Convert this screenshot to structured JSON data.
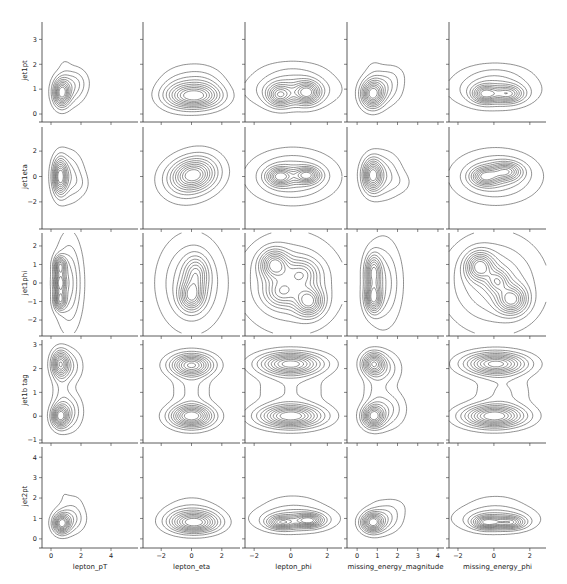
{
  "chart_data": {
    "type": "pairgrid-kde-contour",
    "title": "",
    "grid": false,
    "legend": "none",
    "x_variables": [
      {
        "name": "lepton_pT",
        "xlim": [
          -0.6,
          5.8
        ],
        "ticks": [
          0,
          2,
          4
        ],
        "tick_labels": [
          "0",
          "2",
          "4"
        ]
      },
      {
        "name": "lepton_eta",
        "xlim": [
          -3.2,
          3.2
        ],
        "ticks": [
          -2,
          0,
          2
        ],
        "tick_labels": [
          "−2",
          "0",
          "2"
        ]
      },
      {
        "name": "lepton_phi",
        "xlim": [
          -2.5,
          2.8
        ],
        "ticks": [
          -2,
          0,
          2
        ],
        "tick_labels": [
          "−2",
          "0",
          "2"
        ]
      },
      {
        "name": "missing_energy_magnitude",
        "xlim": [
          -0.5,
          4.3
        ],
        "ticks": [
          0,
          1,
          2,
          3,
          4
        ],
        "tick_labels": [
          "0",
          "1",
          "2",
          "3",
          "4"
        ]
      },
      {
        "name": "missing_energy_phi",
        "xlim": [
          -2.5,
          2.9
        ],
        "ticks": [
          -2,
          0,
          2
        ],
        "tick_labels": [
          "−2",
          "0",
          "2"
        ]
      }
    ],
    "y_variables": [
      {
        "name": "jet1pt",
        "ylim": [
          -0.2,
          3.7
        ],
        "ticks": [
          0,
          1,
          2,
          3
        ],
        "tick_labels": [
          "0",
          "1",
          "2",
          "3"
        ]
      },
      {
        "name": "jet1eta",
        "ylim": [
          -3.9,
          3.9
        ],
        "ticks": [
          -2,
          0,
          2
        ],
        "tick_labels": [
          "−2",
          "0",
          "2"
        ]
      },
      {
        "name": "jet1phi",
        "ylim": [
          -2.7,
          2.7
        ],
        "ticks": [
          -2,
          -1,
          0,
          1,
          2
        ],
        "tick_labels": [
          "−2",
          "−1",
          "0",
          "1",
          "2"
        ]
      },
      {
        "name": "jet1b tag",
        "ylim": [
          -1,
          3.2
        ],
        "ticks": [
          -1,
          0,
          1,
          2,
          3
        ],
        "tick_labels": [
          "−1",
          "0",
          "1",
          "2",
          "3"
        ]
      },
      {
        "name": "jet2pt",
        "ylim": [
          -0.3,
          4.5
        ],
        "ticks": [
          0,
          1,
          2,
          3,
          4
        ],
        "tick_labels": [
          "0",
          "1",
          "2",
          "3",
          "4"
        ]
      }
    ],
    "contour_levels": 10,
    "panels": [
      [
        {
          "blobs": [
            [
              0.7,
              0.85,
              0.35,
              0.35,
              1.0
            ],
            [
              1.3,
              1.1,
              0.6,
              0.45,
              0.35
            ],
            [
              1.9,
              1.3,
              0.5,
              0.35,
              0.08
            ],
            [
              0.9,
              2.0,
              0.3,
              0.25,
              0.05
            ]
          ]
        },
        {
          "blobs": [
            [
              0.2,
              0.7,
              1.1,
              0.3,
              1.0
            ],
            [
              -0.8,
              0.9,
              0.9,
              0.45,
              0.4
            ],
            [
              0.8,
              1.0,
              0.9,
              0.45,
              0.4
            ],
            [
              0.0,
              1.7,
              1.2,
              0.35,
              0.08
            ]
          ]
        },
        {
          "blobs": [
            [
              -0.6,
              0.75,
              0.45,
              0.28,
              0.8
            ],
            [
              0.9,
              0.85,
              0.45,
              0.28,
              0.9
            ],
            [
              0.1,
              1.0,
              1.4,
              0.45,
              0.5
            ],
            [
              0.1,
              1.8,
              1.3,
              0.3,
              0.1
            ]
          ]
        },
        {
          "blobs": [
            [
              0.75,
              0.8,
              0.35,
              0.35,
              1.0
            ],
            [
              1.3,
              1.1,
              0.55,
              0.45,
              0.35
            ],
            [
              1.9,
              1.6,
              0.4,
              0.3,
              0.06
            ],
            [
              0.8,
              1.9,
              0.3,
              0.3,
              0.05
            ]
          ]
        },
        {
          "blobs": [
            [
              -0.5,
              0.8,
              0.45,
              0.22,
              0.9
            ],
            [
              0.8,
              0.8,
              0.55,
              0.22,
              0.8
            ],
            [
              0.0,
              1.0,
              1.4,
              0.45,
              0.5
            ],
            [
              0.1,
              1.7,
              1.3,
              0.3,
              0.1
            ]
          ]
        }
      ],
      [
        {
          "blobs": [
            [
              0.6,
              0.0,
              0.3,
              0.9,
              1.0
            ],
            [
              1.2,
              0.0,
              0.6,
              1.2,
              0.35
            ],
            [
              2.0,
              -0.6,
              0.4,
              0.6,
              0.08
            ]
          ]
        },
        {
          "blobs": [
            [
              0.1,
              0.1,
              0.8,
              0.7,
              1.0
            ],
            [
              -0.6,
              -0.4,
              0.9,
              0.9,
              0.45
            ],
            [
              0.7,
              0.6,
              0.9,
              0.9,
              0.45
            ],
            [
              0.0,
              0.0,
              1.4,
              1.4,
              0.2
            ]
          ]
        },
        {
          "blobs": [
            [
              -0.6,
              0.0,
              0.45,
              0.45,
              0.85
            ],
            [
              0.9,
              0.1,
              0.45,
              0.4,
              0.85
            ],
            [
              0.1,
              0.0,
              1.4,
              1.2,
              0.5
            ]
          ]
        },
        {
          "blobs": [
            [
              0.75,
              0.1,
              0.3,
              0.8,
              1.0
            ],
            [
              1.3,
              0.1,
              0.55,
              1.1,
              0.35
            ],
            [
              2.2,
              -0.5,
              0.4,
              0.6,
              0.08
            ]
          ]
        },
        {
          "blobs": [
            [
              -0.5,
              0.0,
              0.5,
              0.45,
              0.85
            ],
            [
              0.7,
              0.4,
              0.55,
              0.45,
              0.8
            ],
            [
              0.1,
              0.0,
              1.4,
              1.2,
              0.5
            ]
          ]
        }
      ],
      [
        {
          "blobs": [
            [
              0.6,
              0.9,
              0.25,
              0.35,
              0.9
            ],
            [
              0.6,
              0.0,
              0.25,
              0.35,
              0.9
            ],
            [
              0.6,
              -0.9,
              0.25,
              0.35,
              0.9
            ],
            [
              1.2,
              0.0,
              0.55,
              1.5,
              0.45
            ]
          ]
        },
        {
          "blobs": [
            [
              0.0,
              -0.7,
              0.5,
              0.5,
              1.0
            ],
            [
              0.3,
              0.5,
              0.5,
              0.6,
              0.7
            ],
            [
              0.0,
              0.0,
              1.3,
              1.5,
              0.55
            ]
          ]
        },
        {
          "blobs": [
            [
              -0.9,
              1.0,
              0.5,
              0.5,
              0.9
            ],
            [
              1.0,
              -1.0,
              0.5,
              0.5,
              0.9
            ],
            [
              0.6,
              0.5,
              0.6,
              0.5,
              0.55
            ],
            [
              -0.5,
              -0.5,
              0.6,
              0.5,
              0.55
            ],
            [
              0.0,
              0.0,
              1.6,
              1.5,
              0.45
            ]
          ]
        },
        {
          "blobs": [
            [
              0.8,
              -0.8,
              0.25,
              0.5,
              1.0
            ],
            [
              0.8,
              0.6,
              0.25,
              0.6,
              0.85
            ],
            [
              1.3,
              0.0,
              0.55,
              1.4,
              0.4
            ]
          ]
        },
        {
          "blobs": [
            [
              -0.8,
              0.9,
              0.5,
              0.5,
              0.85
            ],
            [
              1.0,
              -0.9,
              0.55,
              0.5,
              0.85
            ],
            [
              0.2,
              0.1,
              0.4,
              0.4,
              0.55
            ],
            [
              0.0,
              0.0,
              1.6,
              1.5,
              0.45
            ]
          ]
        }
      ],
      [
        {
          "blobs": [
            [
              0.6,
              2.2,
              0.35,
              0.35,
              0.9
            ],
            [
              0.6,
              0.0,
              0.35,
              0.3,
              1.0
            ],
            [
              1.2,
              0.2,
              0.55,
              0.5,
              0.35
            ],
            [
              1.2,
              2.1,
              0.55,
              0.45,
              0.3
            ],
            [
              0.7,
              1.1,
              0.4,
              0.6,
              0.15
            ]
          ]
        },
        {
          "blobs": [
            [
              0.0,
              2.15,
              0.9,
              0.3,
              0.9
            ],
            [
              0.0,
              0.0,
              0.9,
              0.3,
              1.0
            ],
            [
              0.0,
              1.1,
              0.8,
              0.7,
              0.18
            ]
          ]
        },
        {
          "blobs": [
            [
              0.0,
              2.2,
              1.1,
              0.3,
              0.95
            ],
            [
              0.0,
              0.0,
              1.1,
              0.3,
              1.0
            ],
            [
              0.0,
              1.1,
              1.2,
              0.7,
              0.16
            ]
          ]
        },
        {
          "blobs": [
            [
              0.8,
              2.2,
              0.35,
              0.3,
              0.9
            ],
            [
              0.8,
              0.0,
              0.35,
              0.3,
              1.0
            ],
            [
              1.5,
              0.3,
              0.55,
              0.5,
              0.3
            ],
            [
              1.4,
              2.0,
              0.5,
              0.45,
              0.25
            ],
            [
              0.9,
              1.1,
              0.4,
              0.6,
              0.14
            ]
          ]
        },
        {
          "blobs": [
            [
              0.1,
              2.2,
              1.1,
              0.3,
              0.95
            ],
            [
              0.0,
              0.0,
              1.1,
              0.3,
              1.0
            ],
            [
              0.5,
              1.0,
              1.0,
              0.6,
              0.17
            ]
          ]
        }
      ],
      [
        {
          "blobs": [
            [
              0.7,
              0.75,
              0.35,
              0.3,
              1.0
            ],
            [
              1.3,
              1.0,
              0.6,
              0.45,
              0.35
            ],
            [
              1.5,
              1.9,
              0.6,
              0.35,
              0.06
            ],
            [
              0.8,
              2.3,
              0.3,
              0.3,
              0.04
            ]
          ]
        },
        {
          "blobs": [
            [
              0.2,
              0.75,
              1.0,
              0.3,
              1.0
            ],
            [
              -0.6,
              1.0,
              0.9,
              0.4,
              0.45
            ],
            [
              0.7,
              1.0,
              0.9,
              0.4,
              0.45
            ],
            [
              0.0,
              1.9,
              1.1,
              0.35,
              0.07
            ]
          ]
        },
        {
          "blobs": [
            [
              -0.5,
              0.8,
              0.5,
              0.2,
              0.8
            ],
            [
              1.0,
              0.9,
              0.5,
              0.2,
              0.9
            ],
            [
              0.2,
              1.0,
              1.3,
              0.4,
              0.5
            ],
            [
              0.1,
              1.9,
              1.3,
              0.35,
              0.08
            ]
          ]
        },
        {
          "blobs": [
            [
              0.75,
              0.8,
              0.35,
              0.3,
              1.0
            ],
            [
              1.3,
              1.0,
              0.55,
              0.45,
              0.35
            ],
            [
              1.9,
              1.6,
              0.5,
              0.35,
              0.07
            ],
            [
              0.8,
              2.3,
              0.3,
              0.3,
              0.04
            ]
          ]
        },
        {
          "blobs": [
            [
              -0.4,
              0.8,
              0.5,
              0.2,
              0.9
            ],
            [
              0.9,
              0.8,
              0.55,
              0.2,
              0.8
            ],
            [
              0.1,
              1.0,
              1.3,
              0.4,
              0.5
            ],
            [
              0.1,
              1.9,
              1.3,
              0.35,
              0.08
            ]
          ]
        }
      ]
    ]
  }
}
